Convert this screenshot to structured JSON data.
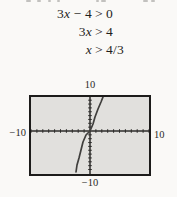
{
  "derivation": {
    "lines": [
      {
        "lhs": "3x − 4",
        "op": ">",
        "rhs": "0"
      },
      {
        "lhs": "3x",
        "op": ">",
        "rhs": "4"
      },
      {
        "lhs": "x",
        "op": ">",
        "rhs": "4/3"
      }
    ]
  },
  "chart_data": {
    "type": "line",
    "function": "y = 3x − 4",
    "x_intercept": 1.3333,
    "window": {
      "xmin": -10,
      "xmax": 10,
      "ymin": -10,
      "ymax": 10,
      "xscl": 1,
      "yscl": 1
    },
    "axis_labels": {
      "top": "10",
      "left": "−10",
      "right": "10",
      "bottom": "−10"
    },
    "axes": {
      "y_axis_px": 59,
      "x_axis_py": 34,
      "width_px": 118,
      "height_px": 77
    },
    "curve_points_px": [
      [
        45,
        75
      ],
      [
        46,
        68
      ],
      [
        48,
        61
      ],
      [
        50,
        53
      ],
      [
        52,
        45
      ],
      [
        55,
        38
      ],
      [
        59,
        34
      ],
      [
        62,
        27
      ],
      [
        64,
        20
      ],
      [
        67,
        12
      ],
      [
        70,
        5
      ],
      [
        72,
        0
      ]
    ],
    "colors": {
      "screen_bg": "#e1e0dd",
      "border": "#1c1b1a",
      "axis": "#2d2c2a",
      "curve": "#403f3d",
      "text": "#1f1e1c"
    }
  },
  "fragments": {
    "positions_px": [
      26,
      37,
      48,
      57,
      96,
      101,
      143,
      151
    ]
  }
}
